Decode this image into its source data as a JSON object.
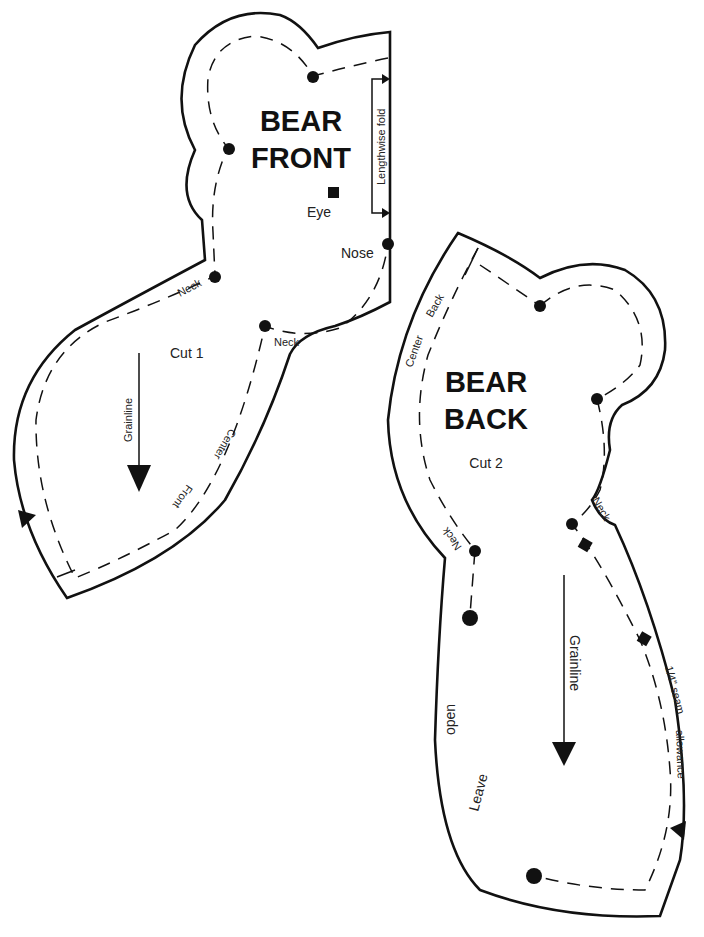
{
  "front_piece": {
    "title_line1": "BEAR",
    "title_line2": "FRONT",
    "cut_label": "Cut 1",
    "eye_label": "Eye",
    "nose_label": "Nose",
    "fold_label": "Lengthwise fold",
    "neck_label_left": "Neck",
    "neck_label_right": "Neck",
    "grainline_label": "Grainline",
    "center_label": "Center",
    "front_label": "Front"
  },
  "back_piece": {
    "title_line1": "BEAR",
    "title_line2": "BACK",
    "cut_label": "Cut 2",
    "center_label": "Center",
    "back_label": "Back",
    "neck_label_left": "Neck",
    "neck_label_right": "Neck",
    "grainline_label": "Grainline",
    "seam_label": "1/4\" seam",
    "allowance_label": "allowance",
    "leave_label": "Leave",
    "open_label": "open"
  },
  "colors": {
    "ink": "#111111",
    "paper": "#ffffff"
  }
}
